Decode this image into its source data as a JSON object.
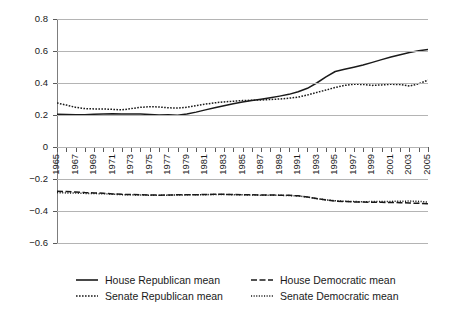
{
  "chart_data": {
    "type": "line",
    "title": "",
    "subtitle": "",
    "xlabel": "",
    "ylabel": "",
    "xlim": [
      1965,
      2005
    ],
    "ylim": [
      -0.6,
      0.8
    ],
    "ytick_values": [
      0.8,
      0.6,
      0.4,
      0.2,
      0,
      -0.2,
      -0.4,
      -0.6
    ],
    "ytick_labels": [
      "0.8",
      "0.6",
      "0.4",
      "0.2",
      "0",
      "−0.2",
      "−0.4",
      "−0.6"
    ],
    "grid": "horizontal",
    "legend_position": "bottom",
    "x": [
      1965,
      1966,
      1967,
      1968,
      1969,
      1970,
      1971,
      1972,
      1973,
      1974,
      1975,
      1976,
      1977,
      1978,
      1979,
      1980,
      1981,
      1982,
      1983,
      1984,
      1985,
      1986,
      1987,
      1988,
      1989,
      1990,
      1991,
      1992,
      1993,
      1994,
      1995,
      1996,
      1997,
      1998,
      1999,
      2000,
      2001,
      2002,
      2003,
      2004,
      2005
    ],
    "xtick_labels": [
      "1965",
      "1967",
      "1969",
      "1971",
      "1973",
      "1975",
      "1977",
      "1979",
      "1981",
      "1983",
      "1985",
      "1987",
      "1989",
      "1991",
      "1993",
      "1995",
      "1997",
      "1999",
      "2001",
      "2003",
      "2005"
    ],
    "series": [
      {
        "name": "House Republican mean",
        "style": "solid",
        "color": "#1a1a1a",
        "values": [
          0.205,
          0.203,
          0.201,
          0.202,
          0.205,
          0.207,
          0.208,
          0.206,
          0.207,
          0.206,
          0.203,
          0.2,
          0.201,
          0.199,
          0.206,
          0.218,
          0.232,
          0.245,
          0.258,
          0.27,
          0.281,
          0.291,
          0.299,
          0.308,
          0.318,
          0.329,
          0.345,
          0.367,
          0.4,
          0.438,
          0.472,
          0.486,
          0.499,
          0.513,
          0.529,
          0.546,
          0.562,
          0.577,
          0.59,
          0.601,
          0.61
        ]
      },
      {
        "name": "House Democratic mean",
        "style": "dashed",
        "color": "#1a1a1a",
        "values": [
          -0.277,
          -0.278,
          -0.281,
          -0.285,
          -0.287,
          -0.289,
          -0.293,
          -0.296,
          -0.297,
          -0.298,
          -0.3,
          -0.301,
          -0.3,
          -0.299,
          -0.298,
          -0.298,
          -0.297,
          -0.296,
          -0.296,
          -0.297,
          -0.298,
          -0.299,
          -0.3,
          -0.3,
          -0.301,
          -0.302,
          -0.305,
          -0.312,
          -0.322,
          -0.331,
          -0.338,
          -0.341,
          -0.343,
          -0.344,
          -0.345,
          -0.346,
          -0.347,
          -0.348,
          -0.35,
          -0.352,
          -0.355
        ]
      },
      {
        "name": "Senate Republican mean",
        "style": "dotted",
        "color": "#1a1a1a",
        "values": [
          0.275,
          0.262,
          0.248,
          0.24,
          0.238,
          0.238,
          0.235,
          0.232,
          0.24,
          0.248,
          0.252,
          0.25,
          0.245,
          0.243,
          0.248,
          0.258,
          0.268,
          0.276,
          0.282,
          0.286,
          0.29,
          0.292,
          0.294,
          0.297,
          0.3,
          0.305,
          0.312,
          0.325,
          0.341,
          0.356,
          0.372,
          0.385,
          0.392,
          0.391,
          0.385,
          0.388,
          0.392,
          0.39,
          0.381,
          0.395,
          0.418
        ]
      },
      {
        "name": "Senate Democratic mean",
        "style": "dotted-fine",
        "color": "#1a1a1a",
        "values": [
          -0.285,
          -0.287,
          -0.288,
          -0.29,
          -0.291,
          -0.292,
          -0.295,
          -0.298,
          -0.299,
          -0.3,
          -0.301,
          -0.302,
          -0.301,
          -0.3,
          -0.299,
          -0.299,
          -0.298,
          -0.297,
          -0.297,
          -0.298,
          -0.299,
          -0.3,
          -0.301,
          -0.301,
          -0.302,
          -0.303,
          -0.306,
          -0.313,
          -0.323,
          -0.33,
          -0.336,
          -0.339,
          -0.341,
          -0.342,
          -0.341,
          -0.34,
          -0.34,
          -0.339,
          -0.338,
          -0.34,
          -0.344
        ]
      }
    ]
  },
  "legend": {
    "items": [
      {
        "label": "House Republican mean",
        "style": "solid"
      },
      {
        "label": "House Democratic mean",
        "style": "dashed"
      },
      {
        "label": "Senate Republican mean",
        "style": "dotted"
      },
      {
        "label": "Senate Democratic mean",
        "style": "dotted-fine"
      }
    ]
  }
}
